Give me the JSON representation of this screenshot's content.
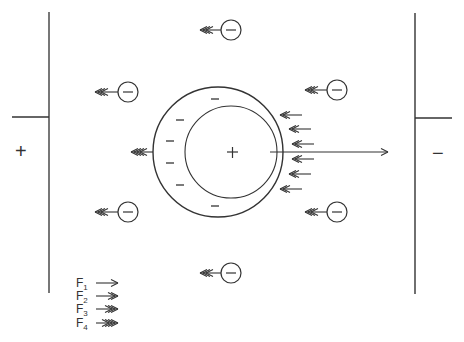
{
  "plates": {
    "left": {
      "sign": "+"
    },
    "right": {
      "sign": "−"
    }
  },
  "particle": {
    "core_sign": "+",
    "cloud_charges": [
      "−",
      "−",
      "−",
      "−",
      "−",
      "−",
      "−"
    ]
  },
  "ions": [
    {
      "sign": "−",
      "position": "top"
    },
    {
      "sign": "−",
      "position": "upper-left"
    },
    {
      "sign": "−",
      "position": "upper-right"
    },
    {
      "sign": "−",
      "position": "lower-left"
    },
    {
      "sign": "−",
      "position": "lower-right"
    },
    {
      "sign": "−",
      "position": "bottom"
    }
  ],
  "legend": [
    {
      "label": "F",
      "sub": "1",
      "heads": 1
    },
    {
      "label": "F",
      "sub": "2",
      "heads": 2
    },
    {
      "label": "F",
      "sub": "3",
      "heads": 3
    },
    {
      "label": "F",
      "sub": "4",
      "heads": 4
    }
  ],
  "colors": {
    "stroke": "#333333",
    "background": "#ffffff"
  }
}
